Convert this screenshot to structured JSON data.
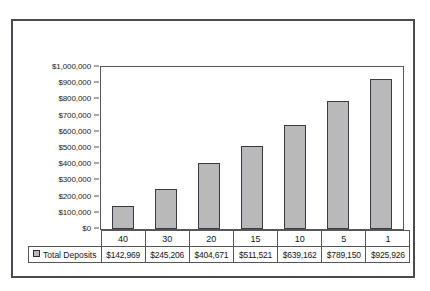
{
  "chart_data": {
    "type": "bar",
    "title": "",
    "subtitle": "",
    "xlabel": "",
    "ylabel": "",
    "categories": [
      "40",
      "30",
      "20",
      "15",
      "10",
      "5",
      "1"
    ],
    "series": [
      {
        "name": "Total Deposits",
        "values": [
          142969,
          245206,
          404671,
          511521,
          639162,
          789150,
          925926
        ],
        "value_labels": [
          "$142,969",
          "$245,206",
          "$404,671",
          "$511,521",
          "$639,162",
          "$789,150",
          "$925,926"
        ],
        "color": "#b9b9b9"
      }
    ],
    "ylim": [
      0,
      1000000
    ],
    "ytick_labels": [
      "$1,000,000",
      "$900,000",
      "$800,000",
      "$700,000",
      "$600,000",
      "$500,000",
      "$400,000",
      "$300,000",
      "$200,000",
      "$100,000",
      "$0"
    ],
    "ytick_values": [
      1000000,
      900000,
      800000,
      700000,
      600000,
      500000,
      400000,
      300000,
      200000,
      100000,
      0
    ],
    "grid": false,
    "legend_position": "data-table-row",
    "data_table_visible": true
  },
  "legend": {
    "series_label": "Total Deposits",
    "swatch_name": "legend-swatch"
  },
  "colors": {
    "bar_fill": "#b9b9b9",
    "bar_outline": "#3a3a42",
    "frame_border": "#4a4a52",
    "axis_line": "#55555d",
    "text": "#15151a",
    "background": "#ffffff"
  }
}
